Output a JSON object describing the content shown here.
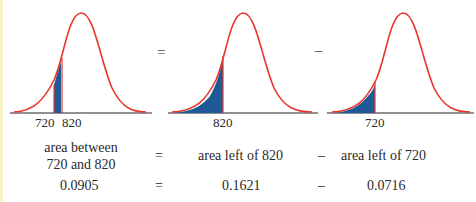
{
  "colors": {
    "curve": "#e8362a",
    "shade": "#1e5a96",
    "axis": "#222222",
    "edge": "#fbf3c8"
  },
  "panels": [
    {
      "id": "between",
      "shaded": "between 720 and 820",
      "tick_labels": [
        "720",
        "820"
      ]
    },
    {
      "id": "left-820",
      "shaded": "left of 820",
      "tick_labels": [
        "820"
      ]
    },
    {
      "id": "left-720",
      "shaded": "left of 720",
      "tick_labels": [
        "720"
      ]
    }
  ],
  "operators": {
    "equals": "=",
    "minus": "–"
  },
  "equation": {
    "row1": {
      "lhs_line1": "area between",
      "lhs_line2": "720 and 820",
      "eq": "=",
      "mid": "area left of 820",
      "minus": "–",
      "rhs": "area left of 720"
    },
    "row2": {
      "lhs": "0.0905",
      "eq": "=",
      "mid": "0.1621",
      "minus": "–",
      "rhs": "0.0716"
    }
  }
}
